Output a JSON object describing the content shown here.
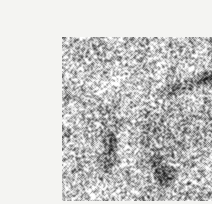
{
  "page": {
    "background_color": "#f4f4f2",
    "width": 212,
    "height": 204
  },
  "figure": {
    "name": "noisy-grayscale-scan",
    "panel": {
      "x": 22,
      "y": 21,
      "width": 170,
      "height": 164,
      "border": "none",
      "base_gray": "#b9b9b9"
    },
    "render": {
      "type": "speckle-noise-image",
      "colorspace": "grayscale",
      "noise_model": "salt-and-pepper",
      "noise_amplitude": 0.96,
      "grain_pixel_size": 1,
      "speckle_low": "#101010",
      "speckle_high": "#ffffff",
      "background_mean_level": 0.74,
      "smoothing_passes": 1,
      "seed": 20240517
    },
    "structures": [
      {
        "name": "diagonal-dark-streak-upper-right",
        "shape": "ellipse",
        "cx": 148,
        "cy": 41,
        "rx": 30,
        "ry": 9,
        "rotation_deg": -16,
        "darkness": 0.62
      },
      {
        "name": "diagonal-dark-streak-tail",
        "shape": "ellipse",
        "cx": 112,
        "cy": 52,
        "rx": 20,
        "ry": 7,
        "rotation_deg": -10,
        "darkness": 0.4
      },
      {
        "name": "vertical-dark-streak-left-center",
        "shape": "ellipse",
        "cx": 47,
        "cy": 110,
        "rx": 9,
        "ry": 31,
        "rotation_deg": 6,
        "darkness": 0.48
      },
      {
        "name": "faint-vertical-midline",
        "shape": "ellipse",
        "cx": 84,
        "cy": 95,
        "rx": 8,
        "ry": 40,
        "rotation_deg": 0,
        "darkness": 0.26
      },
      {
        "name": "dark-blob-lower-center",
        "shape": "ellipse",
        "cx": 103,
        "cy": 138,
        "rx": 14,
        "ry": 14,
        "rotation_deg": 20,
        "darkness": 0.55
      },
      {
        "name": "dark-blob-lower-center-tail",
        "shape": "ellipse",
        "cx": 96,
        "cy": 122,
        "rx": 8,
        "ry": 16,
        "rotation_deg": 0,
        "darkness": 0.3
      },
      {
        "name": "soft-shadow-right-of-center",
        "shape": "ellipse",
        "cx": 128,
        "cy": 96,
        "rx": 22,
        "ry": 26,
        "rotation_deg": 0,
        "darkness": 0.18
      },
      {
        "name": "bright-patch-lower-left",
        "shape": "ellipse",
        "cx": 38,
        "cy": 150,
        "rx": 24,
        "ry": 18,
        "rotation_deg": 0,
        "darkness": -0.18
      },
      {
        "name": "bright-patch-upper-left",
        "shape": "ellipse",
        "cx": 52,
        "cy": 40,
        "rx": 26,
        "ry": 20,
        "rotation_deg": 0,
        "darkness": -0.12
      },
      {
        "name": "bright-patch-right-edge",
        "shape": "ellipse",
        "cx": 158,
        "cy": 120,
        "rx": 20,
        "ry": 26,
        "rotation_deg": 0,
        "darkness": -0.14
      }
    ]
  }
}
